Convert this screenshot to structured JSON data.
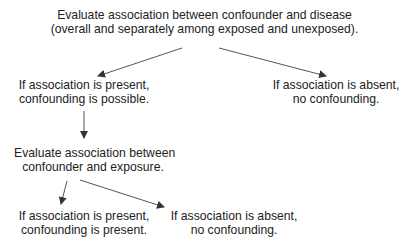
{
  "diagram": {
    "type": "flowchart",
    "colors": {
      "text": "#222222",
      "arrow": "#333333",
      "background": "#ffffff"
    },
    "nodes": {
      "root": {
        "line1": "Evaluate association between confounder and disease",
        "line2": "(overall and separately among exposed and unexposed)."
      },
      "present_1": {
        "line1": "If association is present,",
        "line2": "confounding is possible."
      },
      "absent_1": {
        "line1": "If association is absent,",
        "line2": "no confounding."
      },
      "evaluate_2": {
        "line1": "Evaluate association between",
        "line2": "confounder and exposure."
      },
      "present_2": {
        "line1": "If association is present,",
        "line2": "confounding is present."
      },
      "absent_2": {
        "line1": "If association is absent,",
        "line2": "no confounding."
      }
    },
    "edges": [
      {
        "from": "root",
        "to": "present_1"
      },
      {
        "from": "root",
        "to": "absent_1"
      },
      {
        "from": "present_1",
        "to": "evaluate_2"
      },
      {
        "from": "evaluate_2",
        "to": "present_2"
      },
      {
        "from": "evaluate_2",
        "to": "absent_2"
      }
    ]
  }
}
